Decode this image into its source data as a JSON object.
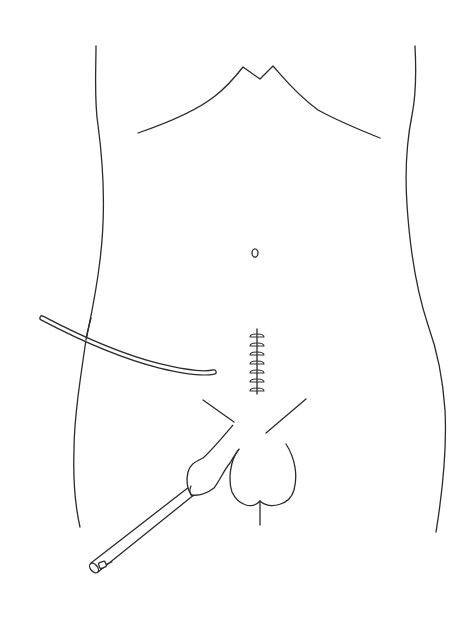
{
  "figure": {
    "title": "",
    "ink_color": "#2b2b2b",
    "background": "#ffffff",
    "width": 475,
    "height": 632
  },
  "elements": {
    "costal_margin": {
      "label": "costal margin / rib line",
      "apex": [
        255,
        72
      ]
    },
    "body_outline_left": {
      "label": "left flank outline"
    },
    "body_outline_right": {
      "label": "right flank outline"
    },
    "umbilicus": {
      "label": "umbilicus",
      "center": [
        255,
        253
      ]
    },
    "incision_sutures": {
      "label": "midline incision with sutures",
      "stitch_count": 7,
      "top": 331,
      "bottom": 392,
      "x": 257
    },
    "drain_tube": {
      "label": "drain tube",
      "start": [
        42,
        318
      ],
      "end": [
        216,
        373
      ]
    },
    "groin_lines": {
      "label": "inguinal creases"
    },
    "scrotum": {
      "label": "scrotum",
      "raphe_bottom": [
        260,
        525
      ]
    },
    "instrument": {
      "label": "catheter / instrument with hand grip",
      "tip": [
        95,
        568
      ],
      "valve_position": [
        102,
        565
      ]
    }
  }
}
